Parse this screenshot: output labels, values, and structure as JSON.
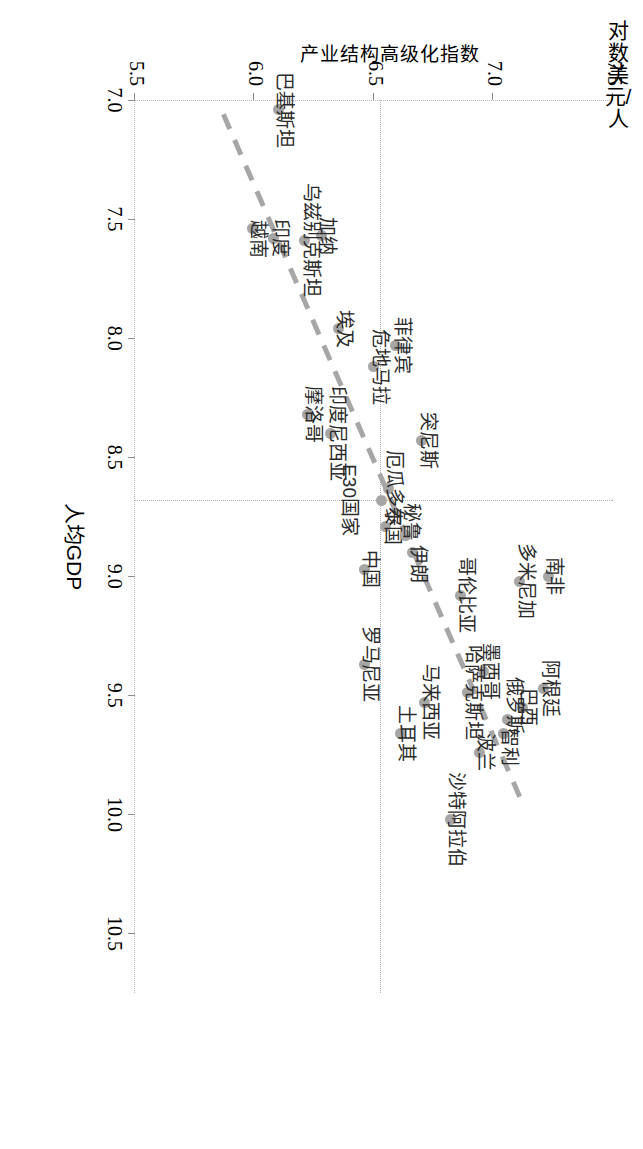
{
  "chart_data": {
    "type": "scatter",
    "title": "",
    "xlabel": "人均GDP",
    "xlabel_unit": "对数美元/人",
    "ylabel": "产业结构高级化指数",
    "xlim": [
      7.0,
      10.75
    ],
    "ylim": [
      5.5,
      7.5
    ],
    "xticks": [
      "7.0",
      "7.5",
      "8.0",
      "8.5",
      "9.0",
      "9.5",
      "10.0",
      "10.5"
    ],
    "xtick_values": [
      7.0,
      7.5,
      8.0,
      8.5,
      9.0,
      9.5,
      10.0,
      10.5
    ],
    "yticks": [
      "5.5",
      "6.0",
      "6.5",
      "7.0",
      "7.5"
    ],
    "ytick_values": [
      5.5,
      6.0,
      6.5,
      7.0,
      7.5
    ],
    "grid": false,
    "legend": "none",
    "marker_color": "#a6a6a6",
    "trend_color": "#a6a6a6",
    "reference_lines": {
      "x": 8.68,
      "y": 6.53,
      "style": "dotted",
      "color": "#aeaeae"
    },
    "trend_line": {
      "style": "dashed",
      "x_start": 7.06,
      "y_start": 5.87,
      "x_end": 9.95,
      "y_end": 7.12
    },
    "points": [
      {
        "label": "巴基斯坦",
        "x": 7.04,
        "y": 6.1,
        "label_dx": 0,
        "label_dy": -22,
        "align": "center"
      },
      {
        "label": "加纳",
        "x": 7.57,
        "y": 6.28,
        "label_dx": 0,
        "label_dy": -22,
        "align": "center"
      },
      {
        "label": "乌兹别克斯坦",
        "x": 7.59,
        "y": 6.21,
        "label_dx": 0,
        "label_dy": -22,
        "align": "center"
      },
      {
        "label": "印度",
        "x": 7.58,
        "y": 6.08,
        "label_dx": 0,
        "label_dy": -22,
        "align": "center"
      },
      {
        "label": "越南",
        "x": 7.54,
        "y": 5.99,
        "label_dx": 10,
        "label_dy": -22,
        "align": "center"
      },
      {
        "label": "埃及",
        "x": 7.96,
        "y": 6.35,
        "label_dx": 0,
        "label_dy": -22,
        "align": "center"
      },
      {
        "label": "菲律宾",
        "x": 8.03,
        "y": 6.59,
        "label_dx": 0,
        "label_dy": -22,
        "align": "center"
      },
      {
        "label": "危地马拉",
        "x": 8.12,
        "y": 6.5,
        "label_dx": 0,
        "label_dy": -22,
        "align": "center"
      },
      {
        "label": "摩洛哥",
        "x": 8.32,
        "y": 6.22,
        "label_dx": 0,
        "label_dy": -22,
        "align": "center"
      },
      {
        "label": "印度尼西亚",
        "x": 8.4,
        "y": 6.32,
        "label_dx": 0,
        "label_dy": -22,
        "align": "center"
      },
      {
        "label": "突尼斯",
        "x": 8.43,
        "y": 6.7,
        "label_dx": 0,
        "label_dy": -22,
        "align": "center"
      },
      {
        "label": "厄瓜多尔",
        "x": 8.63,
        "y": 6.56,
        "label_dx": 0,
        "label_dy": -22,
        "align": "center"
      },
      {
        "label": "E30国家",
        "x": 8.68,
        "y": 6.53,
        "label_dx": 0,
        "label_dy": 16,
        "align": "center"
      },
      {
        "label": "泰国",
        "x": 8.79,
        "y": 6.55,
        "label_dx": 0,
        "label_dy": -22,
        "align": "center"
      },
      {
        "label": "秘鲁",
        "x": 8.83,
        "y": 6.63,
        "label_dx": -14,
        "label_dy": -22,
        "align": "center"
      },
      {
        "label": "伊朗",
        "x": 8.9,
        "y": 6.66,
        "label_dx": 12,
        "label_dy": -22,
        "align": "center"
      },
      {
        "label": "中国",
        "x": 8.97,
        "y": 6.46,
        "label_dx": 0,
        "label_dy": -22,
        "align": "center"
      },
      {
        "label": "南非",
        "x": 9.0,
        "y": 7.23,
        "label_dx": 0,
        "label_dy": -22,
        "align": "center"
      },
      {
        "label": "多米尼加",
        "x": 9.02,
        "y": 7.11,
        "label_dx": 0,
        "label_dy": -22,
        "align": "center"
      },
      {
        "label": "哥伦比亚",
        "x": 9.08,
        "y": 6.86,
        "label_dx": 0,
        "label_dy": -22,
        "align": "center"
      },
      {
        "label": "罗马尼亚",
        "x": 9.37,
        "y": 6.46,
        "label_dx": 0,
        "label_dy": -22,
        "align": "center"
      },
      {
        "label": "墨西哥",
        "x": 9.4,
        "y": 6.96,
        "label_dx": 0,
        "label_dy": -22,
        "align": "center"
      },
      {
        "label": "阿根廷",
        "x": 9.47,
        "y": 7.21,
        "label_dx": 0,
        "label_dy": -22,
        "align": "center"
      },
      {
        "label": "哈萨克斯坦",
        "x": 9.49,
        "y": 6.89,
        "label_dx": 0,
        "label_dy": -22,
        "align": "center"
      },
      {
        "label": "马来西亚",
        "x": 9.53,
        "y": 6.71,
        "label_dx": 0,
        "label_dy": -22,
        "align": "center"
      },
      {
        "label": "巴西",
        "x": 9.55,
        "y": 7.12,
        "label_dx": 0,
        "label_dy": -22,
        "align": "center"
      },
      {
        "label": "俄罗斯",
        "x": 9.6,
        "y": 7.06,
        "label_dx": -14,
        "label_dy": -22,
        "align": "center"
      },
      {
        "label": "智利",
        "x": 9.66,
        "y": 7.04,
        "label_dx": 14,
        "label_dy": -22,
        "align": "center"
      },
      {
        "label": "土耳其",
        "x": 9.66,
        "y": 6.61,
        "label_dx": 0,
        "label_dy": -22,
        "align": "center"
      },
      {
        "label": "波兰",
        "x": 9.74,
        "y": 6.94,
        "label_dx": 0,
        "label_dy": -22,
        "align": "center"
      },
      {
        "label": "沙特阿拉伯",
        "x": 10.02,
        "y": 6.82,
        "label_dx": 0,
        "label_dy": -22,
        "align": "center"
      }
    ]
  }
}
